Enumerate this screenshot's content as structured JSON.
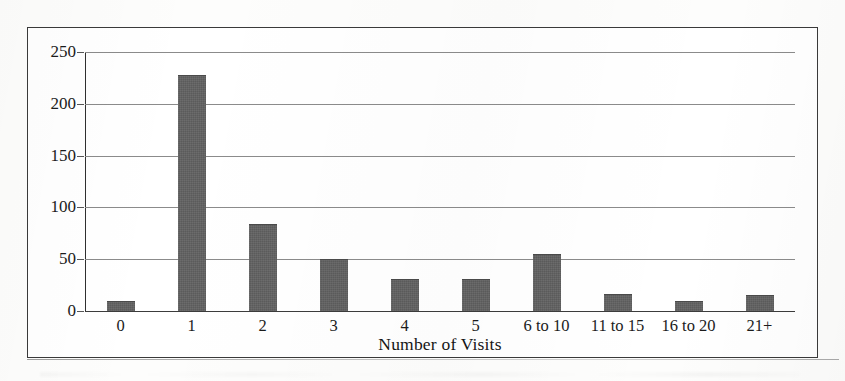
{
  "figure": {
    "frame_visible": true,
    "background_color": "#ffffff",
    "border_color": "#3a3a3a"
  },
  "chart_data": {
    "type": "bar",
    "title": "",
    "xlabel": "Number of Visits",
    "ylabel": "",
    "categories": [
      "0",
      "1",
      "2",
      "3",
      "4",
      "5",
      "6 to 10",
      "11 to 15",
      "16 to 20",
      "21+"
    ],
    "values": [
      10,
      228,
      84,
      50,
      31,
      31,
      55,
      16,
      10,
      15
    ],
    "ylim": [
      0,
      250
    ],
    "yticks": [
      0,
      50,
      100,
      150,
      200,
      250
    ],
    "ytick_labels": [
      "0",
      "50",
      "100",
      "150",
      "200",
      "250"
    ],
    "grid": true,
    "grid_axis": "y",
    "legend": false,
    "bar_color": "#5b5b5b",
    "bar_edge_color": "#4a4a4a",
    "gridline_color": "#8b8b8b",
    "axis_color": "#2f2f2f"
  }
}
